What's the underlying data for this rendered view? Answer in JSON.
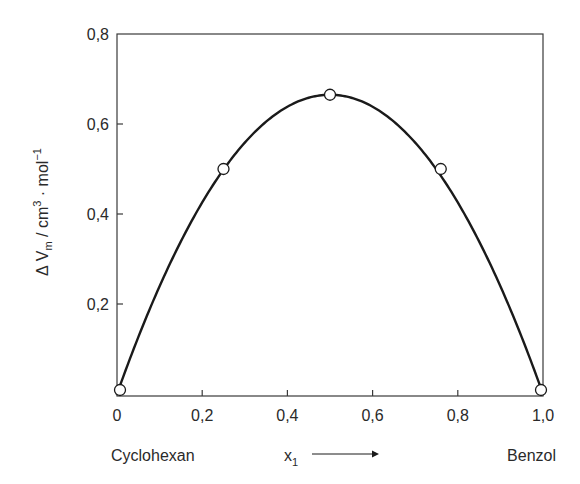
{
  "chart_data": {
    "type": "line",
    "title": "",
    "xlabel": "x1",
    "xlabel_main": "x",
    "xlabel_sub": "1",
    "ylabel": "ΔV_m / cm³ · mol⁻¹",
    "ylabel_parts": {
      "delta": "Δ",
      "v": "V",
      "v_sub": "m",
      "unit": " / cm",
      "unit_sup": "3",
      "mid": " · mol",
      "mol_sup": "−1"
    },
    "xlim": [
      0,
      1.0
    ],
    "ylim": [
      0,
      0.8
    ],
    "xticks": [
      0,
      0.2,
      0.4,
      0.6,
      0.8,
      1.0
    ],
    "xtick_labels": [
      "0",
      "0,2",
      "0,4",
      "0,6",
      "0,8",
      "1,0"
    ],
    "yticks": [
      0.2,
      0.4,
      0.6,
      0.8
    ],
    "ytick_labels": [
      "0,2",
      "0,4",
      "0,6",
      "0,8"
    ],
    "grid": false,
    "left_component_label": "Cyclohexan",
    "right_component_label": "Benzol",
    "series": [
      {
        "name": "measured",
        "style": "open-circle-markers",
        "x": [
          0,
          0.25,
          0.5,
          0.76,
          1.0
        ],
        "y": [
          0.0,
          0.5,
          0.665,
          0.5,
          0.0
        ]
      },
      {
        "name": "fit-curve",
        "style": "solid-line",
        "model": "y = 2.66 * x * (1 - x)",
        "coefficient": 2.66
      }
    ]
  },
  "colors": {
    "ink": "#1a1a1a",
    "frame": "#3a3a3a",
    "background": "#ffffff"
  }
}
